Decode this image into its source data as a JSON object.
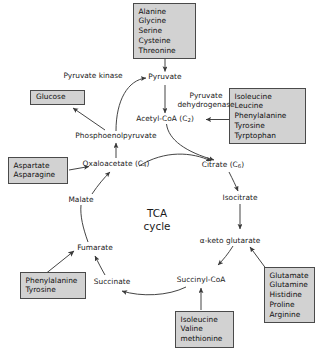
{
  "diagram": {
    "title": "TCA cycle",
    "center_label_line1": "TCA",
    "center_label_line2": "cycle",
    "box_fill": "#d2d2d2",
    "box_stroke": "#4a4a4a",
    "line_color": "#3a3a3a",
    "text_color": "#1a1a1a"
  },
  "metabolites": {
    "pyruvate": "Pyruvate",
    "acetyl_coa": "Acetyl-CoA (C",
    "acetyl_coa_sub": "2",
    "acetyl_coa_tail": ")",
    "pep": "Phosphoenolpyruvate",
    "oxaloacetate": "Oxaloacetate (C",
    "oxaloacetate_sub": "4",
    "oxaloacetate_tail": ")",
    "citrate": "Citrate (C",
    "citrate_sub": "6",
    "citrate_tail": ")",
    "isocitrate": "Isocitrate",
    "alpha_keto_glutarate": "α-keto glutarate",
    "succinyl_coa": "Succinyl-CoA",
    "succinate": "Succinate",
    "fumarate": "Fumarate",
    "malate": "Malate"
  },
  "enzymes": {
    "pyruvate_kinase": "Pyruvate kinase",
    "pyruvate_dehydrogenase_line1": "Pyruvate",
    "pyruvate_dehydrogenase_line2": "dehydrogenase"
  },
  "boxes": {
    "glucose": {
      "name": "glucose-box",
      "lines": [
        "Glucose"
      ]
    },
    "pyruvate_precursors": {
      "name": "pyruvate-amino-acids-box",
      "lines": [
        "Alanine",
        "Glycine",
        "Serine",
        "Cysteine",
        "Threonine"
      ]
    },
    "acetyl_coa_precursors": {
      "name": "acetyl-coa-amino-acids-box",
      "lines": [
        "Isoleucine",
        "Leucine",
        "Phenylalanine",
        "Tyrosine",
        "Tyrptophan"
      ]
    },
    "oxaloacetate_precursors": {
      "name": "oxaloacetate-amino-acids-box",
      "lines": [
        "Aspartate",
        "Asparagine"
      ]
    },
    "fumarate_precursors": {
      "name": "fumarate-amino-acids-box",
      "lines": [
        "Phenylalanine",
        "Tyrosine"
      ]
    },
    "succinyl_coa_precursors": {
      "name": "succinyl-coa-amino-acids-box",
      "lines": [
        "Isoleucine",
        "Valine",
        "methionine"
      ]
    },
    "alpha_keto_precursors": {
      "name": "alpha-keto-glutarate-amino-acids-box",
      "lines": [
        "Glutamate",
        "Glutamine",
        "Histidine",
        "Proline",
        "Arginine"
      ]
    }
  }
}
